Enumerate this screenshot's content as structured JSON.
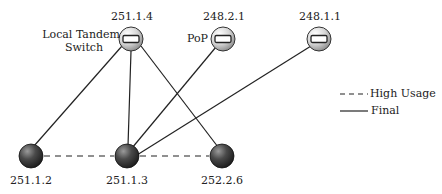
{
  "diagram": {
    "nodes": [
      {
        "id": "251.1.4",
        "label": "251.1.4",
        "role_label": "Local Tandem\nSwitch",
        "type": "switch",
        "x": 131,
        "y": 39
      },
      {
        "id": "248.2.1",
        "label": "248.2.1",
        "role_label": "PoP",
        "type": "switch",
        "x": 223,
        "y": 39
      },
      {
        "id": "248.1.1",
        "label": "248.1.1",
        "type": "switch",
        "x": 319,
        "y": 39
      },
      {
        "id": "251.1.2",
        "label": "251.1.2",
        "type": "endpoint",
        "x": 31,
        "y": 156
      },
      {
        "id": "251.1.3",
        "label": "251.1.3",
        "type": "endpoint",
        "x": 127,
        "y": 156
      },
      {
        "id": "252.2.6",
        "label": "252.2.6",
        "type": "endpoint",
        "x": 222,
        "y": 156
      }
    ],
    "edges": [
      {
        "from": "251.1.4",
        "to": "251.1.2",
        "style": "final"
      },
      {
        "from": "251.1.4",
        "to": "251.1.3",
        "style": "final"
      },
      {
        "from": "251.1.4",
        "to": "252.2.6",
        "style": "final"
      },
      {
        "from": "248.2.1",
        "to": "251.1.3",
        "style": "final"
      },
      {
        "from": "248.1.1",
        "to": "251.1.3",
        "style": "final"
      },
      {
        "from": "251.1.2",
        "to": "251.1.3",
        "style": "high-usage"
      },
      {
        "from": "251.1.3",
        "to": "252.2.6",
        "style": "high-usage"
      }
    ],
    "labels": {
      "node_251_1_4": "251.1.4",
      "node_248_2_1": "248.2.1",
      "node_248_1_1": "248.1.1",
      "node_251_1_2": "251.1.2",
      "node_251_1_3": "251.1.3",
      "node_252_2_6": "252.2.6",
      "local_tandem_line1": "Local Tandem",
      "local_tandem_line2": "Switch",
      "pop": "PoP"
    },
    "legend": {
      "high_usage": "High Usage",
      "final": "Final"
    }
  }
}
